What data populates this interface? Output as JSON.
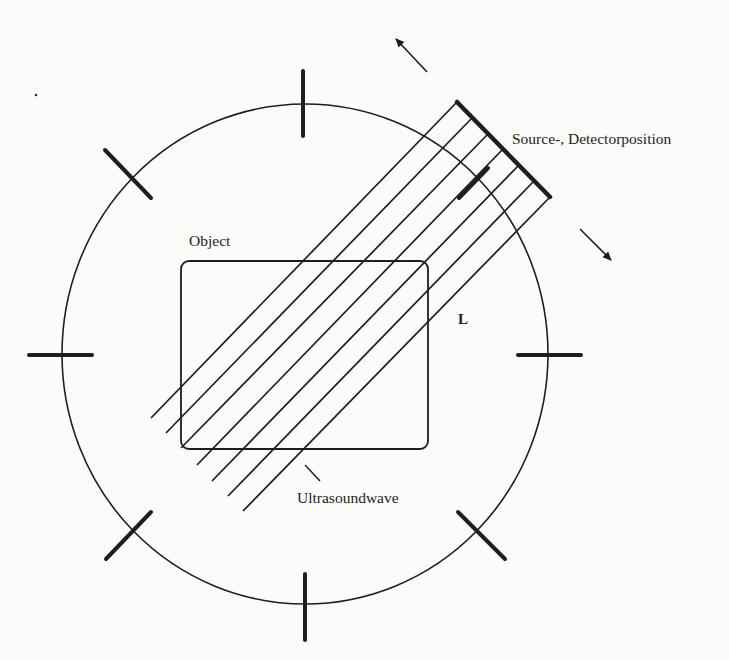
{
  "diagram": {
    "colors": {
      "ink": "#1e1e1e",
      "background": "#fbfbf9"
    },
    "labels": {
      "source_detector": "Source-, Detectorposition",
      "object": "Object",
      "length": "L",
      "ultrasoundwave": "Ultrasoundwave"
    },
    "circle": {
      "cx": 305,
      "cy": 354,
      "rx": 243,
      "ry": 250
    },
    "ticks": [
      {
        "name": "tick-top",
        "x1": 303,
        "y1": 71,
        "x2": 303,
        "y2": 136
      },
      {
        "name": "tick-bottom",
        "x1": 305,
        "y1": 574,
        "x2": 305,
        "y2": 640
      },
      {
        "name": "tick-left",
        "x1": 29,
        "y1": 355,
        "x2": 92,
        "y2": 355
      },
      {
        "name": "tick-right",
        "x1": 518,
        "y1": 355,
        "x2": 581,
        "y2": 355
      },
      {
        "name": "tick-upper-left",
        "x1": 105,
        "y1": 150,
        "x2": 151,
        "y2": 198
      },
      {
        "name": "tick-lower-right",
        "x1": 458,
        "y1": 512,
        "x2": 505,
        "y2": 559
      },
      {
        "name": "tick-lower-left",
        "x1": 106,
        "y1": 559,
        "x2": 151,
        "y2": 512
      },
      {
        "name": "tick-upper-right",
        "x1": 459,
        "y1": 198,
        "x2": 488,
        "y2": 168
      }
    ],
    "object_rect": {
      "x": 181,
      "y": 261,
      "width": 247,
      "height": 188,
      "rx": 8
    },
    "detector_bar": {
      "x1": 457,
      "y1": 102,
      "x2": 550,
      "y2": 197
    },
    "beams": [
      {
        "x1": 457,
        "y1": 102,
        "x2": 151,
        "y2": 418
      },
      {
        "x1": 472,
        "y1": 118,
        "x2": 166,
        "y2": 433
      },
      {
        "x1": 488,
        "y1": 134,
        "x2": 181,
        "y2": 448
      },
      {
        "x1": 503,
        "y1": 149,
        "x2": 197,
        "y2": 465
      },
      {
        "x1": 519,
        "y1": 165,
        "x2": 212,
        "y2": 481
      },
      {
        "x1": 534,
        "y1": 181,
        "x2": 228,
        "y2": 496
      },
      {
        "x1": 550,
        "y1": 197,
        "x2": 243,
        "y2": 511
      }
    ],
    "arrows": [
      {
        "name": "rotate-ccw-arrow",
        "x1": 427,
        "y1": 72,
        "x2": 396,
        "y2": 39
      },
      {
        "name": "rotate-cw-arrow",
        "x1": 580,
        "y1": 229,
        "x2": 611,
        "y2": 260
      }
    ],
    "leader": {
      "x1": 305,
      "y1": 465,
      "x2": 320,
      "y2": 481
    },
    "dot": {
      "x": 36,
      "y": 95
    }
  }
}
